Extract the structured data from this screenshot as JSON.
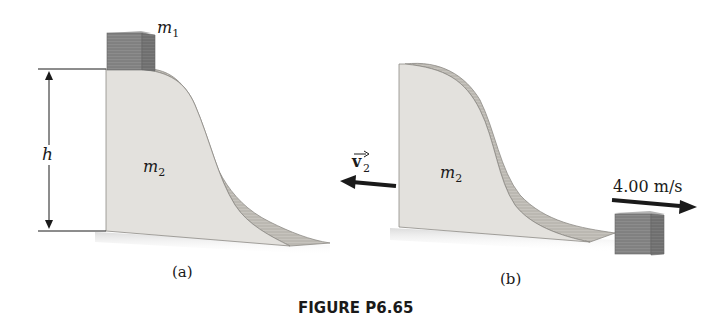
{
  "figure": {
    "caption": "FIGURE P6.65",
    "panel_a": {
      "label": "(a)",
      "block_label": "m",
      "block_sub": "1",
      "wedge_label": "m",
      "wedge_sub": "2",
      "height_label": "h"
    },
    "panel_b": {
      "label": "(b)",
      "wedge_label": "m",
      "wedge_sub": "2",
      "velocity_label": "v",
      "velocity_sub": "2",
      "block_speed": "4.00 m/s"
    },
    "colors": {
      "wedge_face": "#e2e0dc",
      "wedge_side": "#c9c6c0",
      "block": "#8a8a8a",
      "arrow": "#1a1a1a"
    }
  }
}
